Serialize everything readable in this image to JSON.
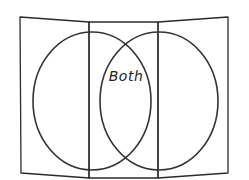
{
  "diagram": {
    "type": "venn-diagram-trifold",
    "background_color": "#ffffff",
    "stroke_color": "#2b2b2b",
    "panels": [
      {
        "name": "left-panel"
      },
      {
        "name": "center-panel"
      },
      {
        "name": "right-panel"
      }
    ],
    "circles": [
      {
        "name": "left-circle",
        "label": ""
      },
      {
        "name": "right-circle",
        "label": ""
      }
    ],
    "intersection": {
      "label": "Both"
    }
  }
}
